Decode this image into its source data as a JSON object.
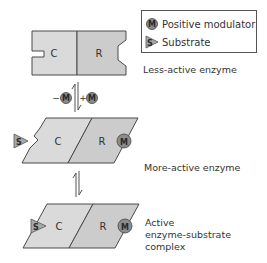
{
  "legend": {
    "items": [
      {
        "icon": "circle-m-icon",
        "glyph": "M",
        "label": "Positive modulator"
      },
      {
        "icon": "triangle-s-icon",
        "glyph": "S",
        "label": "Substrate"
      }
    ]
  },
  "states": [
    {
      "id": "less-active",
      "caption_lines": [
        "Less-active enzyme"
      ],
      "regions": [
        "C",
        "R"
      ]
    },
    {
      "id": "more-active",
      "caption_lines": [
        "More-active enzyme"
      ],
      "regions": [
        "C",
        "R"
      ],
      "modulator": "M",
      "substrate": "S"
    },
    {
      "id": "complex",
      "caption_lines": [
        "Active",
        "enzyme-substrate",
        "complex"
      ],
      "regions": [
        "C",
        "R"
      ],
      "modulator": "M",
      "substrate": "S"
    }
  ],
  "transitions": [
    {
      "between": [
        "less-active",
        "more-active"
      ],
      "left_label_sign": "−",
      "left_label_glyph": "M",
      "right_label_sign": "+",
      "right_label_glyph": "M"
    },
    {
      "between": [
        "more-active",
        "complex"
      ]
    }
  ],
  "colors": {
    "catalytic_fill": "#dadada",
    "regulatory_fill": "#cccccc",
    "outline": "#4a4a4a",
    "modulator_fill": "#8c8c8c",
    "substrate_fill": "#a8a8a8"
  }
}
